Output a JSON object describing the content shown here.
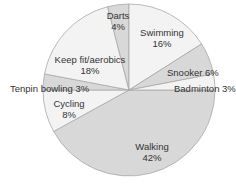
{
  "chart_data": {
    "type": "pie",
    "title": "",
    "categories": [
      "Walking",
      "Cycling",
      "Tenpin bowling",
      "Keep fit/aerobics",
      "Darts",
      "Swimming",
      "Snooker",
      "Badminton"
    ],
    "values": [
      42,
      8,
      3,
      18,
      4,
      16,
      6,
      3
    ],
    "unit": "%",
    "start_angle_deg": 0,
    "direction": "clockwise-from-3-o-clock",
    "legend": "none (direct labels)",
    "slices": [
      {
        "label": "Walking",
        "value": 42,
        "value_label": "42%",
        "color": "#d8d8d8"
      },
      {
        "label": "Cycling",
        "value": 8,
        "value_label": "8%",
        "color": "#f3f3f3"
      },
      {
        "label": "Tenpin bowling",
        "value": 3,
        "value_label": "3%",
        "color": "#d8d8d8"
      },
      {
        "label": "Keep fit/aerobics",
        "value": 18,
        "value_label": "18%",
        "color": "#f3f3f3"
      },
      {
        "label": "Darts",
        "value": 4,
        "value_label": "4%",
        "color": "#d8d8d8"
      },
      {
        "label": "Swimming",
        "value": 16,
        "value_label": "16%",
        "color": "#f3f3f3"
      },
      {
        "label": "Snooker",
        "value": 6,
        "value_label": "6%",
        "color": "#d8d8d8"
      },
      {
        "label": "Badminton",
        "value": 3,
        "value_label": "3%",
        "color": "#f3f3f3"
      }
    ]
  },
  "labels": {
    "walking": {
      "name": "Walking",
      "pct": "42%"
    },
    "cycling": {
      "name": "Cycling",
      "pct": "8%"
    },
    "tenpin": {
      "text": "Tenpin bowling 3%"
    },
    "keepfit": {
      "name": "Keep fit/aerobics",
      "pct": "18%"
    },
    "darts": {
      "name": "Darts",
      "pct": "4%"
    },
    "swimming": {
      "name": "Swimming",
      "pct": "16%"
    },
    "snooker": {
      "text": "Snooker 6%"
    },
    "badminton": {
      "text": "Badminton 3%"
    }
  },
  "colors": {
    "light": "#f3f3f3",
    "shaded": "#d8d8d8",
    "stroke": "#a8a8a8",
    "text": "#333333"
  }
}
